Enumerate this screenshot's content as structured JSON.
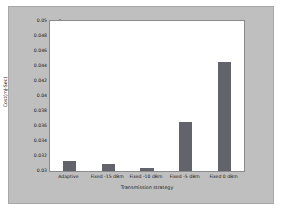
{
  "chart_data": {
    "type": "bar",
    "title": "",
    "xlabel": "Transmission strategy",
    "ylabel": "Cost(mJ-Sec)",
    "categories": [
      "Adaptive",
      "Fixed -15 dBm",
      "Fixed -10 dBm",
      "Fixed -5 dBm",
      "Fixed 0 dBm"
    ],
    "values": [
      0.0313,
      0.0309,
      0.0304,
      0.0365,
      0.0446
    ],
    "ylim": [
      0.03,
      0.05
    ],
    "yticks": [
      0.03,
      0.032,
      0.034,
      0.036,
      0.038,
      0.04,
      0.042,
      0.044,
      0.046,
      0.048,
      0.05
    ],
    "ytick_labels": [
      "0.03",
      "0.032",
      "0.034",
      "0.036",
      "0.038",
      "0.04",
      "0.042",
      "0.044",
      "0.046",
      "0.048",
      "0.05"
    ],
    "grid": false,
    "legend": null,
    "bar_color": "#63636b",
    "plot_background": "#ffffff",
    "figure_background": "#bfbfbf"
  }
}
